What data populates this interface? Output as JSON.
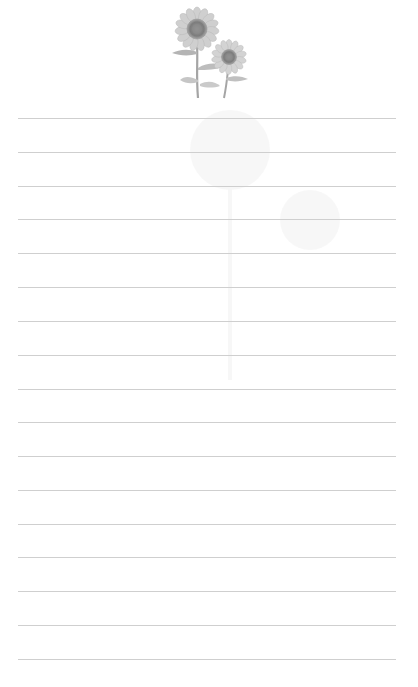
{
  "page": {
    "type": "lined-stationery",
    "background_color": "#ffffff",
    "line_color": "#cfcfcf",
    "decoration": {
      "icon": "sunflower-illustration",
      "count": 2
    },
    "rules": {
      "count": 17,
      "left": 18,
      "width": 378,
      "positions_y": [
        118,
        152,
        186,
        219,
        253,
        287,
        321,
        355,
        389,
        422,
        456,
        490,
        524,
        557,
        591,
        625,
        659
      ]
    }
  }
}
